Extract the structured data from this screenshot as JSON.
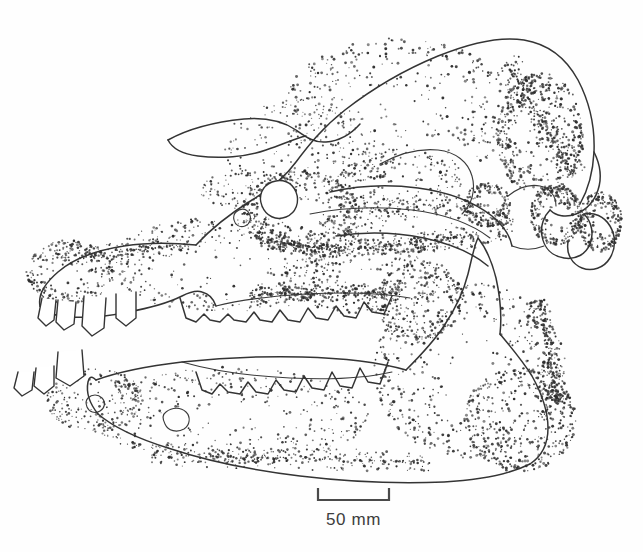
{
  "figure": {
    "kind": "scientific-line-illustration",
    "technique": "stippled pen-and-ink",
    "background_color": "#fefefe",
    "ink_color": "#343434",
    "width": 643,
    "height": 552
  },
  "scale_bar": {
    "label": "50 mm",
    "value": 50,
    "unit": "mm",
    "bar_left_x": 318,
    "bar_right_x": 389,
    "bar_y": 500,
    "tick_height": 12,
    "caption_y": 510,
    "color": "#4a4a4a"
  },
  "anatomy": {
    "parts": [
      {
        "name": "cranium",
        "label": "Cranium"
      },
      {
        "name": "nasal-bone",
        "label": "Nasal"
      },
      {
        "name": "premaxilla",
        "label": "Premaxilla"
      },
      {
        "name": "maxilla",
        "label": "Maxilla"
      },
      {
        "name": "orbit",
        "label": "Orbit"
      },
      {
        "name": "zygomatic-arch",
        "label": "Zygomatic arch"
      },
      {
        "name": "occipital-region",
        "label": "Occipital region"
      },
      {
        "name": "occipital-condyle",
        "label": "Occipital condyle"
      },
      {
        "name": "paroccipital-process",
        "label": "Paroccipital process"
      },
      {
        "name": "mandible",
        "label": "Mandible"
      },
      {
        "name": "mandibular-ramus",
        "label": "Mandibular ramus"
      },
      {
        "name": "upper-dentition",
        "label": "Upper dentition"
      },
      {
        "name": "lower-dentition",
        "label": "Lower dentition"
      },
      {
        "name": "upper-canine",
        "label": "Upper canine"
      },
      {
        "name": "lower-incisors",
        "label": "Lower incisors"
      },
      {
        "name": "mental-foramen",
        "label": "Mental foramen"
      },
      {
        "name": "infraorbital-foramen",
        "label": "Infraorbital foramen"
      }
    ]
  },
  "stipple": {
    "seed": 20240517,
    "regions": [
      {
        "name": "cranial-vault",
        "cx": 400,
        "cy": 110,
        "rx": 118,
        "ry": 72,
        "count": 420,
        "min_r": 0.55,
        "max_r": 1.5,
        "density_bias": 0.62
      },
      {
        "name": "frontal-slope",
        "cx": 300,
        "cy": 150,
        "rx": 78,
        "ry": 52,
        "count": 175,
        "min_r": 0.5,
        "max_r": 1.25,
        "density_bias": 0.5
      },
      {
        "name": "occipital-crest",
        "cx": 540,
        "cy": 135,
        "rx": 44,
        "ry": 62,
        "count": 390,
        "min_r": 0.6,
        "max_r": 1.6,
        "density_bias": 1.25
      },
      {
        "name": "occipital-condyle",
        "cx": 556,
        "cy": 215,
        "rx": 26,
        "ry": 30,
        "count": 250,
        "min_r": 0.6,
        "max_r": 1.55,
        "density_bias": 1.2
      },
      {
        "name": "paroccipital-process",
        "cx": 600,
        "cy": 222,
        "rx": 22,
        "ry": 30,
        "count": 215,
        "min_r": 0.6,
        "max_r": 1.5,
        "density_bias": 1.15
      },
      {
        "name": "orbit-rim",
        "cx": 300,
        "cy": 212,
        "rx": 58,
        "ry": 42,
        "count": 340,
        "min_r": 0.55,
        "max_r": 1.5,
        "density_bias": 1.05
      },
      {
        "name": "zygomatic-arch",
        "cx": 420,
        "cy": 225,
        "rx": 96,
        "ry": 28,
        "count": 300,
        "min_r": 0.55,
        "max_r": 1.45,
        "density_bias": 0.95
      },
      {
        "name": "temporal-fossa",
        "cx": 400,
        "cy": 185,
        "rx": 64,
        "ry": 34,
        "count": 190,
        "min_r": 0.5,
        "max_r": 1.3,
        "density_bias": 0.7
      },
      {
        "name": "maxilla-body",
        "cx": 225,
        "cy": 265,
        "rx": 120,
        "ry": 48,
        "count": 330,
        "min_r": 0.5,
        "max_r": 1.4,
        "density_bias": 0.72
      },
      {
        "name": "rostrum-tip",
        "cx": 70,
        "cy": 272,
        "rx": 44,
        "ry": 32,
        "count": 230,
        "min_r": 0.55,
        "max_r": 1.45,
        "density_bias": 1.0
      },
      {
        "name": "cheek-plate",
        "cx": 360,
        "cy": 280,
        "rx": 82,
        "ry": 34,
        "count": 250,
        "min_r": 0.55,
        "max_r": 1.45,
        "density_bias": 0.9
      },
      {
        "name": "mandible-ramus",
        "cx": 470,
        "cy": 370,
        "rx": 96,
        "ry": 88,
        "count": 560,
        "min_r": 0.55,
        "max_r": 1.5,
        "density_bias": 0.88
      },
      {
        "name": "mandible-angle",
        "cx": 520,
        "cy": 420,
        "rx": 56,
        "ry": 52,
        "count": 330,
        "min_r": 0.6,
        "max_r": 1.55,
        "density_bias": 1.05
      },
      {
        "name": "mandible-body",
        "cx": 230,
        "cy": 415,
        "rx": 140,
        "ry": 48,
        "count": 400,
        "min_r": 0.5,
        "max_r": 1.4,
        "density_bias": 0.72
      },
      {
        "name": "mandible-symphysis",
        "cx": 95,
        "cy": 400,
        "rx": 48,
        "ry": 32,
        "count": 200,
        "min_r": 0.5,
        "max_r": 1.35,
        "density_bias": 0.85
      },
      {
        "name": "coronoid-base",
        "cx": 420,
        "cy": 300,
        "rx": 44,
        "ry": 40,
        "count": 210,
        "min_r": 0.55,
        "max_r": 1.45,
        "density_bias": 0.95
      },
      {
        "name": "nasal-shadow",
        "cx": 250,
        "cy": 190,
        "rx": 50,
        "ry": 20,
        "count": 120,
        "min_r": 0.5,
        "max_r": 1.25,
        "density_bias": 0.8
      },
      {
        "name": "condyle-shadow",
        "cx": 487,
        "cy": 205,
        "rx": 24,
        "ry": 22,
        "count": 175,
        "min_r": 0.6,
        "max_r": 1.5,
        "density_bias": 1.2
      }
    ],
    "shadow_bands": [
      {
        "name": "dorsal-occipital-shade",
        "x1": 505,
        "y1": 60,
        "x2": 575,
        "y2": 175,
        "count": 260,
        "spread": 14,
        "min_r": 0.6,
        "max_r": 1.5
      },
      {
        "name": "zygomatic-under-shade",
        "x1": 330,
        "y1": 252,
        "x2": 470,
        "y2": 236,
        "count": 200,
        "spread": 9,
        "min_r": 0.55,
        "max_r": 1.4
      },
      {
        "name": "orbit-lower-shade",
        "x1": 255,
        "y1": 238,
        "x2": 330,
        "y2": 250,
        "count": 150,
        "spread": 8,
        "min_r": 0.55,
        "max_r": 1.4
      },
      {
        "name": "maxilla-toothrow-shade",
        "x1": 250,
        "y1": 295,
        "x2": 400,
        "y2": 292,
        "count": 230,
        "spread": 8,
        "min_r": 0.55,
        "max_r": 1.45
      },
      {
        "name": "mandible-ventral-shade",
        "x1": 150,
        "y1": 455,
        "x2": 430,
        "y2": 462,
        "count": 280,
        "spread": 11,
        "min_r": 0.55,
        "max_r": 1.4
      },
      {
        "name": "ramus-posterior-shade",
        "x1": 540,
        "y1": 300,
        "x2": 558,
        "y2": 405,
        "count": 210,
        "spread": 10,
        "min_r": 0.6,
        "max_r": 1.5
      },
      {
        "name": "snout-dorsal-shade",
        "x1": 60,
        "y1": 258,
        "x2": 190,
        "y2": 244,
        "count": 170,
        "spread": 9,
        "min_r": 0.5,
        "max_r": 1.35
      }
    ]
  },
  "outlines": {
    "cranium_dorsal": "M 196 245 C 208 232 228 215 252 200 C 272 188 286 176 296 162 C 308 146 322 128 345 110 C 372 89 404 70 438 56 C 470 43 500 36 524 40 C 548 44 566 58 578 80 C 590 103 595 128 594 152 C 593 172 588 190 580 204",
    "nasal_process": "M 168 140 C 186 130 214 122 244 119 C 268 117 284 122 296 130 C 306 137 314 143 326 142 C 340 141 352 133 360 124",
    "nasal_lower": "M 168 140 C 172 148 182 154 198 156 C 220 159 246 157 266 150 C 284 144 296 138 306 136",
    "rostrum_dorsal": "M 196 245 C 176 243 150 242 124 246 C 98 250 74 258 58 272 C 44 284 38 296 40 306",
    "rostrum_ventral": "M 40 306 C 44 312 56 316 70 317 C 88 318 110 316 128 312",
    "maxilla_ventral": "M 128 312 C 150 308 170 302 182 296 C 190 292 196 290 202 292 C 210 294 214 300 216 306",
    "palate_line": "M 216 306 C 240 300 272 296 306 294 C 344 292 382 293 410 298",
    "orbit_circle": "M 262 206 C 258 196 262 186 272 182 C 282 178 292 182 296 192 C 300 202 296 213 286 217 C 276 221 266 216 262 206 Z",
    "zygomatic_upper": "M 330 192 C 356 186 388 184 418 188 C 448 192 474 202 492 216 C 504 226 510 236 512 246",
    "zygomatic_lower": "M 336 236 C 362 232 394 232 424 238 C 452 244 474 254 488 266",
    "jugal_bar": "M 310 214 C 340 208 376 206 412 210 C 444 214 472 224 490 238",
    "temporal_crest": "M 380 164 C 398 154 418 148 438 150 C 456 152 468 162 472 176 C 476 190 472 204 462 214",
    "occipital_back": "M 594 152 C 600 164 602 178 598 190 C 594 202 586 210 576 214 C 566 218 556 216 550 210",
    "occipital_condyle": "M 550 210 C 544 216 540 226 542 236 C 544 248 552 256 564 258 C 576 260 586 254 590 244 C 594 234 592 222 584 214",
    "paroccipital": "M 584 214 C 594 212 604 216 610 226 C 616 236 616 248 610 258 C 604 268 592 272 582 268 C 572 264 566 254 568 242",
    "basicranium": "M 512 246 C 522 250 534 250 544 246",
    "occipital_inner": "M 508 196 C 518 188 530 184 540 186 C 550 188 556 196 556 206",
    "mandible_dorsal": "M 96 380 C 118 372 148 366 182 362 C 220 358 262 356 302 357 C 342 358 378 362 406 370",
    "mandible_ramus_front": "M 406 370 C 418 358 432 344 444 326 C 456 308 464 290 468 274 C 472 258 474 246 478 238",
    "mandible_coronoid": "M 478 238 C 486 248 492 262 496 278 C 500 296 502 316 500 334",
    "mandible_posterior": "M 500 334 C 510 346 522 360 532 376 C 542 394 548 412 548 428 C 548 444 542 456 530 464",
    "mandible_ventral": "M 530 464 C 510 474 480 480 444 482 C 400 484 350 482 300 476 C 250 470 204 460 168 448 C 136 438 112 426 98 414",
    "mandible_symphysis": "M 98 414 C 90 404 86 392 88 382 C 90 374 94 378 96 380",
    "mandible_tooth_base": "M 182 362 C 210 370 248 376 290 378 C 330 380 366 378 392 372",
    "upper_canine_a": "M 42 298 L 38 318 L 46 326 L 54 320 L 56 300",
    "upper_canine_b": "M 58 300 L 56 322 L 64 330 L 74 324 L 76 302",
    "upper_canine_c": "M 84 296 L 82 326 L 92 336 L 104 328 L 106 298",
    "upper_canine_d": "M 116 294 L 116 318 L 126 326 L 136 318 L 136 292",
    "lower_incisor_a": "M 18 372 L 14 388 L 22 396 L 32 390 L 34 372",
    "lower_incisor_b": "M 36 368 L 34 386 L 44 394 L 54 386 L 54 366",
    "lower_incisor_c": "M 58 352 L 56 378 L 70 386 L 84 376 L 82 350",
    "upper_toothrow": "M 180 298 L 186 318 L 196 322 L 204 314 L 210 320 L 220 322 L 228 314 L 234 320 L 246 322 L 254 312 L 260 320 L 272 322 L 280 310 L 288 320 L 300 322 L 308 308 L 316 318 L 328 320 L 336 306 L 344 316 L 356 318 L 364 302 L 372 312 L 384 314 L 392 296",
    "lower_toothrow": "M 196 372 L 202 390 L 212 394 L 220 384 L 228 392 L 240 394 L 248 382 L 256 392 L 268 394 L 276 380 L 284 390 L 296 392 L 304 376 L 312 388 L 324 390 L 332 372 L 340 386 L 352 388 L 360 368 L 368 382 L 380 384 L 388 362",
    "mental_foramen_a": "M 88 398 C 92 394 98 394 102 398 C 106 402 105 408 100 411 C 95 414 89 412 87 407 C 85 402 86 400 88 398 Z",
    "mental_foramen_b": "M 166 412 C 172 407 181 407 186 412 C 191 417 190 425 184 429 C 177 433 168 431 165 424 C 162 418 163 414 166 412 Z",
    "infraorbital_foramen": "M 236 212 C 240 208 246 208 249 213 C 252 218 250 224 245 226 C 240 228 235 225 234 220 C 233 216 234 214 236 212 Z"
  }
}
